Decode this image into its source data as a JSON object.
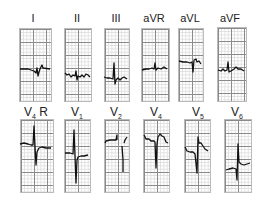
{
  "figure": {
    "type": "12-lead ECG strip panel",
    "rows": [
      {
        "leads": [
          {
            "name": "I",
            "label_main": "I",
            "label_sub": "",
            "label_suffix": ""
          },
          {
            "name": "II",
            "label_main": "II",
            "label_sub": "",
            "label_suffix": ""
          },
          {
            "name": "III",
            "label_main": "III",
            "label_sub": "",
            "label_suffix": ""
          },
          {
            "name": "aVR",
            "label_main": "aVR",
            "label_sub": "",
            "label_suffix": ""
          },
          {
            "name": "aVL",
            "label_main": "aVL",
            "label_sub": "",
            "label_suffix": ""
          },
          {
            "name": "aVF",
            "label_main": "aVF",
            "label_sub": "",
            "label_suffix": ""
          }
        ]
      },
      {
        "leads": [
          {
            "name": "V4R",
            "label_main": "V",
            "label_sub": "4",
            "label_suffix": " R"
          },
          {
            "name": "V1",
            "label_main": "V",
            "label_sub": "1",
            "label_suffix": ""
          },
          {
            "name": "V2",
            "label_main": "V",
            "label_sub": "2",
            "label_suffix": ""
          },
          {
            "name": "V4",
            "label_main": "V",
            "label_sub": "4",
            "label_suffix": ""
          },
          {
            "name": "V5",
            "label_main": "V",
            "label_sub": "5",
            "label_suffix": ""
          },
          {
            "name": "V6",
            "label_main": "V",
            "label_sub": "6",
            "label_suffix": ""
          }
        ]
      }
    ],
    "colors": {
      "grid_major": "#8a8a8a",
      "grid_minor": "#dcdcdc",
      "trace": "#111111",
      "background": "#ffffff"
    }
  }
}
